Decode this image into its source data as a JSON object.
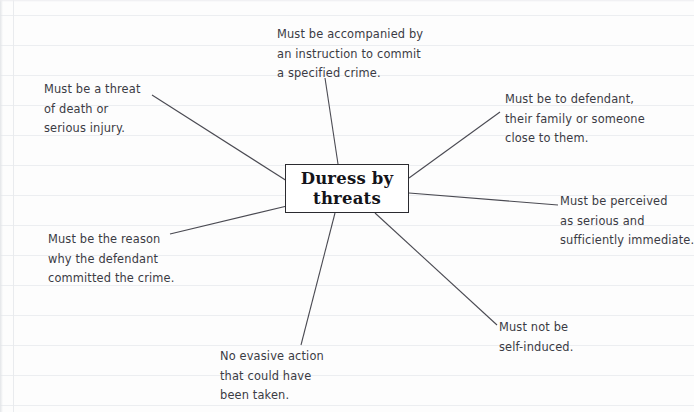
{
  "paper": {
    "rule_color": "#eceef1",
    "margin_color": "#e9ebee",
    "background": "#fdfdfd",
    "rule_spacing_px": 30,
    "margin_x_px": 13
  },
  "diagram": {
    "type": "mind-map",
    "text_color": "#3b3b44",
    "line_color": "#4a4a52",
    "center": {
      "line1": "Duress by",
      "line2": "threats"
    },
    "branches": [
      {
        "id": "accompanied",
        "lines": [
          "Must be accompanied by",
          "an instruction to commit",
          "a specified crime."
        ]
      },
      {
        "id": "threat",
        "lines": [
          "Must be a threat",
          "of death or",
          "serious injury."
        ]
      },
      {
        "id": "defendant",
        "lines": [
          "Must be to defendant,",
          "their family or someone",
          "close to them."
        ]
      },
      {
        "id": "perceived",
        "lines": [
          "Must be perceived",
          "as serious and",
          "sufficiently immediate."
        ]
      },
      {
        "id": "self-induced",
        "lines": [
          "Must not be",
          "self-induced."
        ]
      },
      {
        "id": "no-evasive",
        "lines": [
          "No evasive action",
          "that could have",
          "been taken."
        ]
      },
      {
        "id": "reason",
        "lines": [
          "Must be the reason",
          "why the defendant",
          "committed the crime."
        ]
      }
    ]
  }
}
